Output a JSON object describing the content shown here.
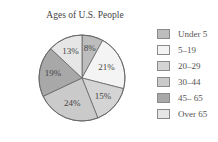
{
  "chart_data": {
    "type": "pie",
    "title": "Ages of U.S. People",
    "categories": [
      "Under 5",
      "5–19",
      "20–29",
      "30–44",
      "45– 65",
      "Over 65"
    ],
    "values": [
      8,
      21,
      15,
      24,
      19,
      13
    ],
    "labels": [
      "8%",
      "21%",
      "15%",
      "24%",
      "19%",
      "13%"
    ],
    "colors": [
      "#bdbdbd",
      "#f4f4f4",
      "#d4d4d4",
      "#cacaca",
      "#a8a8a8",
      "#e6e6e6"
    ],
    "legend_position": "right",
    "start_angle_deg": 0,
    "direction": "clockwise"
  }
}
